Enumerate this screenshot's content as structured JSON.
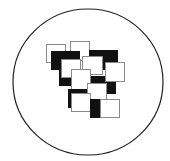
{
  "figure": {
    "colors": {
      "background": "#ffffff",
      "stroke": "#222222",
      "black_fill": "#111111",
      "white_fill": "#ffffff",
      "light_stroke": "#8a8a8a"
    },
    "circle": {
      "cx": 88,
      "cy": 82,
      "rx": 75,
      "ry": 73,
      "stroke_width": 1.2
    },
    "tiles": [
      {
        "id": "A",
        "fill": "white",
        "x": 46,
        "y": 44,
        "w": 19,
        "h": 18
      },
      {
        "id": "B",
        "fill": "white",
        "x": 70,
        "y": 41,
        "w": 19,
        "h": 19
      },
      {
        "id": "C",
        "fill": "black",
        "x": 51,
        "y": 51,
        "w": 28,
        "h": 18
      },
      {
        "id": "D",
        "fill": "black",
        "x": 89,
        "y": 50,
        "w": 28,
        "h": 19
      },
      {
        "id": "H",
        "fill": "black",
        "x": 59,
        "y": 66,
        "w": 14,
        "h": 19
      },
      {
        "id": "J",
        "fill": "black",
        "x": 89,
        "y": 76,
        "w": 26,
        "h": 17
      },
      {
        "id": "E",
        "fill": "white",
        "x": 61,
        "y": 59,
        "w": 19,
        "h": 18
      },
      {
        "id": "F",
        "fill": "white",
        "x": 82,
        "y": 56,
        "w": 20,
        "h": 18
      },
      {
        "id": "G",
        "fill": "white",
        "x": 105,
        "y": 62,
        "w": 19,
        "h": 19
      },
      {
        "id": "I",
        "fill": "white",
        "x": 71,
        "y": 69,
        "w": 19,
        "h": 20
      },
      {
        "id": "K",
        "fill": "white",
        "x": 87,
        "y": 83,
        "w": 19,
        "h": 17
      },
      {
        "id": "L",
        "fill": "black",
        "x": 68,
        "y": 89,
        "w": 18,
        "h": 18
      },
      {
        "id": "M",
        "fill": "white",
        "x": 71,
        "y": 93,
        "w": 19,
        "h": 18
      },
      {
        "id": "N",
        "fill": "black",
        "x": 90,
        "y": 99,
        "w": 23,
        "h": 18
      },
      {
        "id": "O",
        "fill": "white",
        "x": 100,
        "y": 99,
        "w": 19,
        "h": 18
      }
    ]
  }
}
